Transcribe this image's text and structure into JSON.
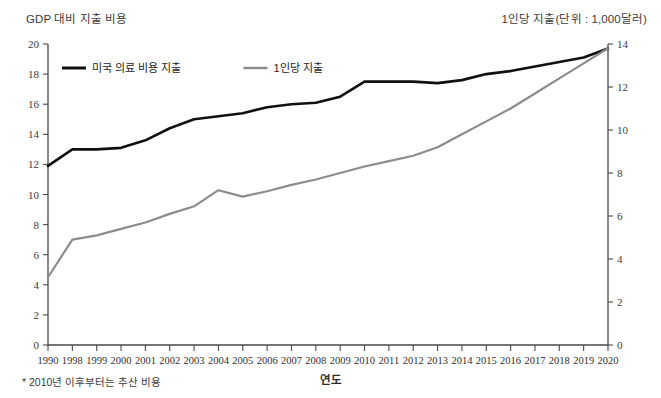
{
  "header": {
    "left_title": "GDP 대비 지출 비용",
    "right_title": "1인당 지출(단위 : 1,000달러)"
  },
  "footnote": "* 2010년 이후부터는 추산 비용",
  "xaxis_title": "연도",
  "legend": {
    "items": [
      {
        "label": "미국 의료 비용 지출",
        "color": "#101010"
      },
      {
        "label": "1인당 지출",
        "color": "#8c8c8c"
      }
    ]
  },
  "chart_data": {
    "type": "line",
    "title": "GDP 대비 지출 비용",
    "xlabel": "연도",
    "ylabel": "GDP 대비 지출 비용",
    "y2label": "1인당 지출(단위 : 1,000달러)",
    "grid": false,
    "legend_position": "top-left",
    "categories": [
      "1990",
      "1998",
      "1999",
      "2000",
      "2001",
      "2002",
      "2003",
      "2004",
      "2005",
      "2006",
      "2007",
      "2008",
      "2009",
      "2010",
      "2011",
      "2012",
      "2013",
      "2014",
      "2015",
      "2016",
      "2017",
      "2018",
      "2019",
      "2020"
    ],
    "ylim": [
      0,
      20
    ],
    "yticks": [
      0,
      2,
      4,
      6,
      8,
      10,
      12,
      14,
      16,
      18,
      20
    ],
    "y2lim": [
      0,
      14
    ],
    "y2ticks": [
      0,
      2,
      4,
      6,
      8,
      10,
      12,
      14
    ],
    "series": [
      {
        "name": "미국 의료 비용 지출",
        "color": "#101010",
        "axis": "left",
        "width": 2.6,
        "values": [
          11.9,
          13.0,
          13.0,
          13.1,
          13.6,
          14.4,
          15.0,
          15.2,
          15.4,
          15.8,
          16.0,
          16.1,
          16.5,
          17.5,
          17.5,
          17.5,
          17.4,
          17.6,
          18.0,
          18.2,
          18.5,
          18.8,
          19.1,
          19.7
        ]
      },
      {
        "name": "1인당 지출",
        "color": "#8c8c8c",
        "axis": "right",
        "width": 2.2,
        "values": [
          3.15,
          4.9,
          5.1,
          5.4,
          5.7,
          6.1,
          6.45,
          7.2,
          6.9,
          7.15,
          7.45,
          7.7,
          8.0,
          8.3,
          8.55,
          8.8,
          9.2,
          9.8,
          10.4,
          11.0,
          11.7,
          12.4,
          13.1,
          13.8
        ]
      }
    ],
    "annotations": [
      "* 2010년 이후부터는 추산 비용"
    ]
  },
  "colors": {
    "background": "#ffffff",
    "axis": "#4a4a4a",
    "text": "#2a2a2a"
  }
}
